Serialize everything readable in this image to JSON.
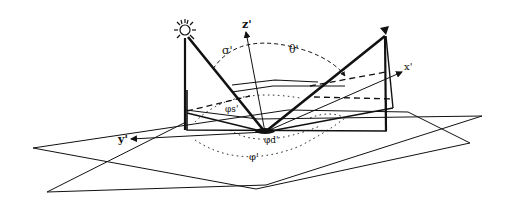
{
  "diagram": {
    "colors": {
      "ink": "#111111",
      "background": "#ffffff"
    },
    "icons": {
      "source": "sun-icon",
      "sensor": "sensor-icon"
    },
    "axes": {
      "z": "z'",
      "x": "x'",
      "y": "y'"
    },
    "angles": {
      "source_zenith": "σ'",
      "view_zenith": "θ'",
      "source_azimuth": "φs'",
      "view_azimuth": "φd'",
      "relative_azimuth": "φ'"
    }
  }
}
